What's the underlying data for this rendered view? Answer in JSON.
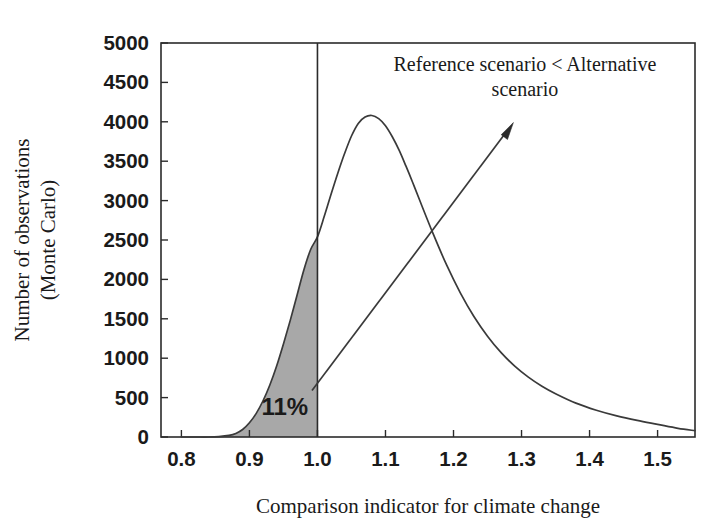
{
  "chart_data": {
    "type": "line",
    "title": "",
    "xlabel": "Comparison indicator for climate change",
    "ylabel_line1": "Number of observations",
    "ylabel_line2": "(Monte Carlo)",
    "xlim": [
      0.77,
      1.555
    ],
    "ylim": [
      0,
      5000
    ],
    "grid": false,
    "legend_position": "none",
    "x_ticks": [
      "0.8",
      "0.9",
      "1.0",
      "1.1",
      "1.2",
      "1.3",
      "1.4",
      "1.5"
    ],
    "x_tick_values": [
      0.8,
      0.9,
      1.0,
      1.1,
      1.2,
      1.3,
      1.4,
      1.5
    ],
    "y_ticks": [
      "0",
      "500",
      "1000",
      "1500",
      "2000",
      "2500",
      "3000",
      "3500",
      "4000",
      "4500",
      "5000"
    ],
    "y_tick_values": [
      0,
      500,
      1000,
      1500,
      2000,
      2500,
      3000,
      3500,
      4000,
      4500,
      5000
    ],
    "series": [
      {
        "name": "Monte Carlo distribution of comparison indicator",
        "x": [
          0.8,
          0.82,
          0.84,
          0.855,
          0.87,
          0.88,
          0.89,
          0.9,
          0.91,
          0.92,
          0.93,
          0.94,
          0.95,
          0.96,
          0.97,
          0.98,
          0.99,
          1.0,
          1.01,
          1.02,
          1.03,
          1.04,
          1.05,
          1.06,
          1.07,
          1.08,
          1.09,
          1.1,
          1.11,
          1.12,
          1.13,
          1.14,
          1.15,
          1.17,
          1.19,
          1.21,
          1.23,
          1.25,
          1.27,
          1.29,
          1.31,
          1.33,
          1.35,
          1.38,
          1.41,
          1.44,
          1.47,
          1.5,
          1.53,
          1.555
        ],
        "y": [
          0,
          0,
          0,
          5,
          20,
          45,
          95,
          180,
          300,
          460,
          660,
          900,
          1180,
          1480,
          1800,
          2120,
          2380,
          2540,
          2800,
          3080,
          3350,
          3600,
          3820,
          3980,
          4060,
          4080,
          4040,
          3950,
          3810,
          3640,
          3440,
          3230,
          3010,
          2580,
          2180,
          1830,
          1530,
          1280,
          1070,
          900,
          760,
          645,
          550,
          430,
          340,
          268,
          210,
          160,
          110,
          80
        ]
      }
    ],
    "annotations": [
      {
        "name": "shaded-tail",
        "type": "area-fill",
        "x_from": 0.852,
        "x_to": 1.0,
        "color": "#a8a8a8",
        "label": "11%",
        "label_x": 0.952,
        "label_y": 280
      },
      {
        "name": "threshold-line",
        "type": "vline",
        "x": 1.0,
        "y_from": 0,
        "y_to": 5000,
        "color": "#2b2b2b"
      },
      {
        "name": "callout-arrow",
        "type": "arrow",
        "tail_x": 0.992,
        "tail_y": 590,
        "head_x": 1.288,
        "head_y": 3990,
        "color": "#2b2b2b"
      },
      {
        "name": "callout-text",
        "type": "text",
        "text_line1": "Reference scenario < Alternative",
        "text_line2": "scenario",
        "x": 1.305,
        "y": 4640
      }
    ],
    "colors": {
      "curve": "#3a3a3a",
      "fill": "#a8a8a8",
      "axis": "#2b2b2b",
      "text": "#1a1a1a",
      "background": "#ffffff"
    }
  }
}
